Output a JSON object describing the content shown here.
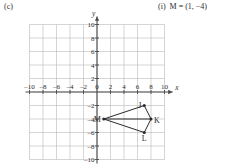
{
  "part": {
    "label": "(c)"
  },
  "answer": {
    "index": "(i)",
    "text": "M = (1, −4)"
  },
  "chart_data": {
    "type": "scatter",
    "title": "",
    "xlabel": "x",
    "ylabel": "y",
    "xlim": [
      -11,
      11
    ],
    "ylim": [
      -11,
      11
    ],
    "grid": true,
    "grid_step": 2,
    "legend": "none",
    "xticks": [
      -10,
      -8,
      -6,
      -4,
      -2,
      0,
      2,
      4,
      6,
      8,
      10
    ],
    "xtick_labels": [
      "-10",
      "-8",
      "-6",
      "-4",
      "-2",
      "0",
      "2",
      "4",
      "6",
      "8",
      "10"
    ],
    "yticks": [
      -10,
      -8,
      -6,
      -4,
      -2,
      0,
      2,
      4,
      6,
      8,
      10
    ],
    "ytick_labels": [
      "-10",
      "-8",
      "-6",
      "-4",
      "-2",
      "0",
      "2",
      "4",
      "6",
      "8",
      "10"
    ],
    "points": [
      {
        "name": "M",
        "x": 1,
        "y": -4,
        "label": "M",
        "label_pos": "left"
      },
      {
        "name": "J",
        "x": 7,
        "y": -2,
        "label": "J",
        "label_pos": "left"
      },
      {
        "name": "K",
        "x": 8,
        "y": -4,
        "label": "K",
        "label_pos": "right"
      },
      {
        "name": "L",
        "x": 7,
        "y": -6,
        "label": "L",
        "label_pos": "below"
      }
    ],
    "polygon": [
      "M",
      "J",
      "K",
      "L"
    ],
    "diagonals": [
      [
        "M",
        "K"
      ]
    ],
    "annotations": []
  },
  "axes": {
    "x_axis_label": "x",
    "y_axis_label": "y",
    "origin_label": "0"
  },
  "colors": {
    "grid": "#b9b9b9",
    "axis": "#4a4a4a",
    "shape_stroke": "#2a2a2a",
    "text": "#2b2b2b",
    "background": "#ffffff"
  }
}
